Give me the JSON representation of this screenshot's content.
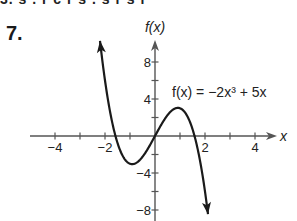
{
  "problem": {
    "number": "7.",
    "cut_off_line": "3. s  .  r c r  s  .  s r  s  r"
  },
  "chart_data": {
    "type": "line",
    "title": "",
    "function_label": "f(x) = −2x³ + 5x",
    "function": {
      "a3": -2,
      "a2": 0,
      "a1": 5,
      "a0": 0
    },
    "xlabel": "x",
    "ylabel": "f(x)",
    "xlim": [
      -4,
      4.9
    ],
    "ylim": [
      -9,
      10.3
    ],
    "x_ticks": [
      -4,
      -3,
      -2,
      -1,
      1,
      2,
      3,
      4
    ],
    "x_tick_labels": [
      {
        "value": -4,
        "label": "−4"
      },
      {
        "value": -2,
        "label": "−2"
      },
      {
        "value": 2,
        "label": "2"
      },
      {
        "value": 4,
        "label": "4"
      }
    ],
    "y_ticks": [
      -8,
      -6,
      -4,
      -2,
      2,
      4,
      6,
      8
    ],
    "y_tick_labels": [
      {
        "value": 8,
        "label": "8"
      },
      {
        "value": 4,
        "label": "4"
      },
      {
        "value": -4,
        "label": "−4"
      },
      {
        "value": -8,
        "label": "−8"
      }
    ],
    "curve_x_range": [
      -2.2,
      2.12
    ],
    "key_points": [
      {
        "x": -1.58,
        "y": 0,
        "note": "x-intercept"
      },
      {
        "x": -0.913,
        "y": -3.04,
        "note": "local minimum"
      },
      {
        "x": 0,
        "y": 0,
        "note": "x-intercept"
      },
      {
        "x": 0.913,
        "y": 3.04,
        "note": "local maximum"
      },
      {
        "x": 1.58,
        "y": 0,
        "note": "x-intercept"
      }
    ],
    "grid": false,
    "legend": "none"
  },
  "colors": {
    "axis": "#555555",
    "curve": "#1a1a1a",
    "text": "#222222"
  }
}
